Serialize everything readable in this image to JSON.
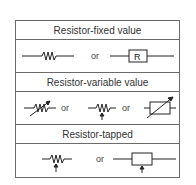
{
  "sections": [
    {
      "title": "Resistor-fixed value",
      "separator": "or",
      "box_label": "R"
    },
    {
      "title": "Resistor-variable value",
      "separators": [
        "or",
        "or"
      ]
    },
    {
      "title": "Resistor-tapped",
      "separator": "or"
    }
  ],
  "colors": {
    "line": "#222222",
    "border": "#6b6b6b",
    "text": "#333333"
  }
}
